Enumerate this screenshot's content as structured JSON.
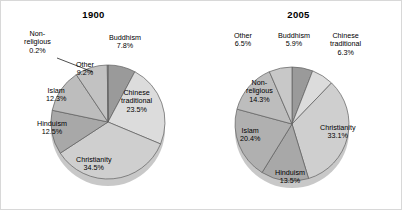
{
  "figure": {
    "background_color": "#ffffff",
    "border_color": "#d8d8d8"
  },
  "chart_data": [
    {
      "type": "pie",
      "title": "1900",
      "xlabel": "",
      "ylabel": "",
      "legend_position": "none",
      "grid": false,
      "labels_inside": true,
      "categories": [
        "Buddhism",
        "Chinese traditional",
        "Christianity",
        "Hinduism",
        "Islam",
        "Other",
        "Non-religious"
      ],
      "values": [
        7.8,
        23.5,
        34.5,
        12.5,
        12.3,
        9.2,
        0.2
      ],
      "value_labels": [
        "7.8%",
        "23.5%",
        "34.5%",
        "12.5%",
        "12.3%",
        "9.2%",
        "0.2%"
      ],
      "slice_colors": [
        "#9a9a9a",
        "#dcdcdc",
        "#cfcfcf",
        "#a8a8a8",
        "#bdbdbd",
        "#c2c2c2",
        "#b5b5b5"
      ],
      "slices": [
        {
          "name": "Buddhism",
          "value": 7.8,
          "value_label": "7.8%",
          "color": "#9a9a9a",
          "label_x": 108,
          "label_y": 33,
          "leader": false,
          "align": "left"
        },
        {
          "name": "Chinese",
          "name2": "traditional",
          "value": 23.5,
          "value_label": "23.5%",
          "color": "#dcdcdc",
          "label_x": 120,
          "label_y": 88,
          "leader": false,
          "align": "center"
        },
        {
          "name": "Christianity",
          "value": 34.5,
          "value_label": "34.5%",
          "color": "#cfcfcf",
          "label_x": 75,
          "label_y": 155,
          "leader": false,
          "align": "center"
        },
        {
          "name": "Hinduism",
          "value": 12.5,
          "value_label": "12.5%",
          "color": "#a8a8a8",
          "label_x": 36,
          "label_y": 119,
          "leader": false,
          "align": "center"
        },
        {
          "name": "Islam",
          "value": 12.3,
          "value_label": "12.3%",
          "color": "#bdbdbd",
          "label_x": 45,
          "label_y": 86,
          "leader": false,
          "align": "center"
        },
        {
          "name": "Other",
          "value": 9.2,
          "value_label": "9.2%",
          "color": "#c2c2c2",
          "label_x": 75,
          "label_y": 60,
          "leader": false,
          "align": "center"
        },
        {
          "name": "Non-",
          "name2": "religious",
          "value": 0.2,
          "value_label": "0.2%",
          "color": "#b5b5b5",
          "label_x": 23,
          "label_y": 29,
          "leader": true,
          "align": "center"
        }
      ],
      "geometry": {
        "cx": 107,
        "cy": 121,
        "rx": 57,
        "ry": 57,
        "depth": 7,
        "start_angle": -90,
        "leader_from_x": 56,
        "leader_from_y": 57,
        "leader_to_x": 92,
        "leader_to_y": 71
      }
    },
    {
      "type": "pie",
      "title": "2005",
      "xlabel": "",
      "ylabel": "",
      "legend_position": "none",
      "grid": false,
      "labels_inside": true,
      "categories": [
        "Buddhism",
        "Chinese traditional",
        "Christianity",
        "Hinduism",
        "Islam",
        "Non-religious",
        "Other"
      ],
      "values": [
        5.9,
        6.3,
        33.1,
        13.5,
        20.4,
        14.3,
        6.5
      ],
      "value_labels": [
        "5.9%",
        "6.3%",
        "33.1%",
        "13.5%",
        "20.4%",
        "14.3%",
        "6.5%"
      ],
      "slice_colors": [
        "#9a9a9a",
        "#dcdcdc",
        "#cfcfcf",
        "#a8a8a8",
        "#b0b0b0",
        "#bdbdbd",
        "#c8c8c8"
      ],
      "slices": [
        {
          "name": "Buddhism",
          "value": 5.9,
          "value_label": "5.9%",
          "color": "#9a9a9a",
          "label_x": 76,
          "label_y": 31,
          "leader": false,
          "align": "center"
        },
        {
          "name": "Chinese",
          "name2": "traditional",
          "value": 6.3,
          "value_label": "6.3%",
          "color": "#dcdcdc",
          "label_x": 128,
          "label_y": 31,
          "leader": false,
          "align": "center"
        },
        {
          "name": "Christianity",
          "value": 33.1,
          "value_label": "33.1%",
          "color": "#cfcfcf",
          "label_x": 118,
          "label_y": 123,
          "leader": false,
          "align": "center"
        },
        {
          "name": "Hinduism",
          "value": 13.5,
          "value_label": "13.5%",
          "color": "#a8a8a8",
          "label_x": 73,
          "label_y": 168,
          "leader": false,
          "align": "center"
        },
        {
          "name": "Islam",
          "value": 20.4,
          "value_label": "20.4%",
          "color": "#b0b0b0",
          "label_x": 38,
          "label_y": 126,
          "leader": false,
          "align": "center"
        },
        {
          "name": "Non-",
          "name2": "religious",
          "value": 14.3,
          "value_label": "14.3%",
          "color": "#bdbdbd",
          "label_x": 44,
          "label_y": 78,
          "leader": false,
          "align": "center"
        },
        {
          "name": "Other",
          "value": 6.5,
          "value_label": "6.5%",
          "color": "#c8c8c8",
          "label_x": 32,
          "label_y": 31,
          "leader": false,
          "align": "center"
        }
      ],
      "geometry": {
        "cx": 90,
        "cy": 123,
        "rx": 57,
        "ry": 57,
        "depth": 7,
        "start_angle": -90,
        "leader_from_x": 0,
        "leader_from_y": 0,
        "leader_to_x": 0,
        "leader_to_y": 0
      }
    }
  ]
}
